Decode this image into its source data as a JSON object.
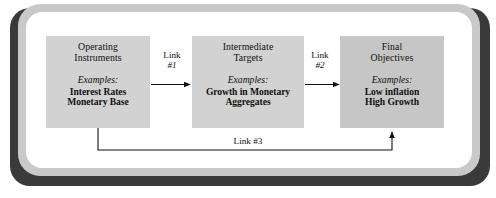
{
  "figure": {
    "frame_color": "#c9c9c9",
    "shadow_color": "#3a3a3a",
    "background": "#ffffff"
  },
  "boxes": [
    {
      "id": "operating-instruments",
      "title_lines": [
        "Operating",
        "Instruments"
      ],
      "examples_label": "Examples:",
      "examples": [
        "Interest Rates",
        "Monetary Base"
      ],
      "fill": "#d2d2d2"
    },
    {
      "id": "intermediate-targets",
      "title_lines": [
        "Intermediate",
        "Targets"
      ],
      "examples_label": "Examples:",
      "examples": [
        "Growth in Monetary",
        "Aggregates"
      ],
      "fill": "#d2d2d2"
    },
    {
      "id": "final-objectives",
      "title_lines": [
        "Final",
        "Objectives"
      ],
      "examples_label": "Examples:",
      "examples": [
        "Low inflation",
        "High Growth"
      ],
      "fill": "#c6c6c6"
    }
  ],
  "links": [
    {
      "id": "link-1",
      "word": "Link",
      "number": "#1",
      "from": "operating-instruments",
      "to": "intermediate-targets"
    },
    {
      "id": "link-2",
      "word": "Link",
      "number": "#2",
      "from": "intermediate-targets",
      "to": "final-objectives"
    },
    {
      "id": "link-3",
      "label": "Link #3",
      "from": "operating-instruments",
      "to": "final-objectives"
    }
  ]
}
